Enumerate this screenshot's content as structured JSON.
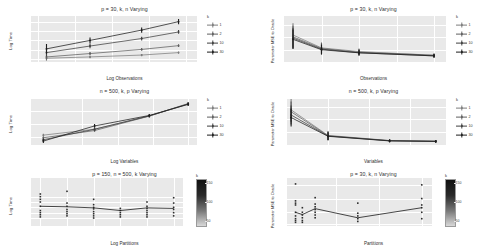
{
  "figure": {
    "style": "ggplot2-grey",
    "layout": "2 columns x 3 rows of facet panels",
    "panel_bg": "#e9e9e9",
    "grid_color": "#ffffff"
  },
  "series_colors": [
    "#7d7d7d",
    "#5f5f5f",
    "#3f3f3f",
    "#1d1d1d"
  ],
  "chart_data": [
    {
      "id": "time-vs-observations",
      "type": "line",
      "title": "p = 30, k, n Varying",
      "xlabel": "Log Observations",
      "ylabel": "Log Time",
      "xlim": [
        4.9,
        7.15
      ],
      "ylim": [
        5.85,
        8.3
      ],
      "xticks": [
        "5.0",
        "5.5",
        "6.0",
        "6.5",
        "7.0"
      ],
      "xtickvals": [
        5.0,
        5.5,
        6.0,
        6.5,
        7.0
      ],
      "yticks": [
        "6.0",
        "6.5",
        "7.0",
        "7.5",
        "8.0"
      ],
      "ytickvals": [
        6.0,
        6.5,
        7.0,
        7.5,
        8.0
      ],
      "grid": true,
      "legend_title": "k",
      "legend_position": "right",
      "x": [
        5.11,
        5.7,
        6.4,
        6.9
      ],
      "series": [
        {
          "name": "1",
          "values": [
            6.05,
            6.12,
            6.22,
            6.35
          ],
          "err": [
            0.13,
            0.07,
            0.06,
            0.06
          ]
        },
        {
          "name": "2",
          "values": [
            6.12,
            6.3,
            6.52,
            6.72
          ],
          "err": [
            0.14,
            0.08,
            0.07,
            0.07
          ]
        },
        {
          "name": "10",
          "values": [
            6.35,
            6.7,
            7.1,
            7.45
          ],
          "err": [
            0.2,
            0.12,
            0.1,
            0.1
          ]
        },
        {
          "name": "30",
          "values": [
            6.55,
            7.0,
            7.55,
            8.0
          ],
          "err": [
            0.26,
            0.16,
            0.14,
            0.14
          ]
        }
      ]
    },
    {
      "id": "mse-vs-observations",
      "type": "line",
      "title": "p = 30, k, n Varying",
      "xlabel": "Observations",
      "ylabel": "Parameter MSE to Oracle",
      "xlim": [
        0,
        1080
      ],
      "ylim": [
        0.0,
        0.0075
      ],
      "xticks": [
        "250",
        "500",
        "750",
        "1000"
      ],
      "xtickvals": [
        250,
        500,
        750,
        1000
      ],
      "yticks": [
        "0.006",
        "0.004",
        "0.002"
      ],
      "ytickvals": [
        0.006,
        0.004,
        0.002
      ],
      "grid": true,
      "legend_title": "k",
      "legend_position": "right",
      "x": [
        60,
        250,
        500,
        1000
      ],
      "series": [
        {
          "name": "1",
          "values": [
            0.0044,
            0.0023,
            0.0017,
            0.0011
          ],
          "err": [
            0.0019,
            0.0009,
            0.0005,
            0.0003
          ]
        },
        {
          "name": "2",
          "values": [
            0.0041,
            0.0022,
            0.0016,
            0.0011
          ],
          "err": [
            0.0018,
            0.0009,
            0.0005,
            0.0003
          ]
        },
        {
          "name": "10",
          "values": [
            0.0039,
            0.0021,
            0.0015,
            0.001
          ],
          "err": [
            0.0017,
            0.0008,
            0.0005,
            0.0003
          ]
        },
        {
          "name": "30",
          "values": [
            0.0037,
            0.002,
            0.0015,
            0.001
          ],
          "err": [
            0.0016,
            0.0008,
            0.0004,
            0.0003
          ]
        }
      ]
    },
    {
      "id": "time-vs-variables",
      "type": "line",
      "title": "n = 500, k, p Varying",
      "xlabel": "Log Variables",
      "ylabel": "Log Time",
      "xlim": [
        0.55,
        5.25
      ],
      "ylim": [
        5.4,
        8.9
      ],
      "xticks": [
        "2",
        "3",
        "4",
        "5"
      ],
      "xtickvals": [
        2,
        3,
        4,
        5
      ],
      "yticks": [
        "8",
        "7",
        "6"
      ],
      "ytickvals": [
        8,
        7,
        6
      ],
      "grid": true,
      "legend_title": "k",
      "legend_position": "right",
      "x": [
        0.9,
        2.35,
        3.9,
        5.0
      ],
      "series": [
        {
          "name": "1",
          "values": [
            6.15,
            6.6,
            7.6,
            8.55
          ],
          "err": [
            0.1,
            0.1,
            0.1,
            0.12
          ]
        },
        {
          "name": "2",
          "values": [
            5.95,
            6.5,
            7.6,
            8.55
          ],
          "err": [
            0.1,
            0.1,
            0.1,
            0.12
          ]
        },
        {
          "name": "10",
          "values": [
            5.8,
            6.6,
            7.62,
            8.5
          ],
          "err": [
            0.12,
            0.12,
            0.1,
            0.12
          ]
        },
        {
          "name": "30",
          "values": [
            5.7,
            6.85,
            7.65,
            8.5
          ],
          "err": [
            0.14,
            0.14,
            0.1,
            0.12
          ]
        }
      ]
    },
    {
      "id": "mse-vs-variables",
      "type": "line",
      "title": "n = 500, k, p Varying",
      "xlabel": "Variables",
      "ylabel": "Parameter MSE to Oracle",
      "xlim": [
        0,
        155
      ],
      "ylim": [
        0.0,
        0.0036
      ],
      "xticks": [
        "40",
        "80",
        "120"
      ],
      "xtickvals": [
        40,
        80,
        120
      ],
      "yticks": [
        "0.0075",
        "0.0050",
        "0.0025",
        "0.0000"
      ],
      "ytickvals": [
        0.003,
        0.002,
        0.001,
        0.0
      ],
      "grid": true,
      "legend_title": "k",
      "legend_position": "right",
      "x": [
        4,
        40,
        100,
        145
      ],
      "series": [
        {
          "name": "1",
          "values": [
            0.00275,
            0.00075,
            0.00035,
            0.0003
          ],
          "err": [
            0.00085,
            0.00035,
            0.00012,
            0.0001
          ]
        },
        {
          "name": "2",
          "values": [
            0.0026,
            0.00072,
            0.00034,
            0.00029
          ],
          "err": [
            0.0008,
            0.00033,
            0.00012,
            0.0001
          ]
        },
        {
          "name": "10",
          "values": [
            0.00235,
            0.0007,
            0.00033,
            0.00029
          ],
          "err": [
            0.00075,
            0.00032,
            0.00011,
            0.0001
          ]
        },
        {
          "name": "30",
          "values": [
            0.00215,
            0.00068,
            0.00032,
            0.00028
          ],
          "err": [
            0.0007,
            0.0003,
            0.00011,
            0.0001
          ]
        }
      ]
    },
    {
      "id": "time-vs-partitions",
      "type": "scatter",
      "title": "p = 150, n = 500, k Varying",
      "xlabel": "Log Partitions",
      "ylabel": "Log Time",
      "xlim": [
        -0.35,
        5.35
      ],
      "ylim": [
        10.45,
        11.35
      ],
      "xticks": [
        "0",
        "1",
        "2",
        "3",
        "4",
        "5"
      ],
      "xtickvals": [
        0,
        1,
        2,
        3,
        4,
        5
      ],
      "yticks": [
        "11.0",
        "10.9",
        "10.8",
        "10.7",
        "10.6"
      ],
      "ytickvals": [
        11.0,
        10.9,
        10.8,
        10.7,
        10.6
      ],
      "grid": true,
      "legend_title": "k",
      "legend_type": "colorbar",
      "legend_ticks": [
        "150",
        "100",
        "50"
      ],
      "legend_tickvals": [
        150,
        100,
        50
      ],
      "trend_x": [
        0,
        1,
        2,
        3,
        4,
        5
      ],
      "trend_y": [
        10.82,
        10.81,
        10.79,
        10.74,
        10.79,
        10.78
      ],
      "points": [
        {
          "x": 0,
          "y": [
            11.05,
            11.0,
            10.95,
            10.9,
            10.82,
            10.74,
            10.7,
            10.66,
            10.62
          ]
        },
        {
          "x": 1,
          "y": [
            11.1,
            10.88,
            10.82,
            10.76,
            10.72,
            10.68,
            10.64
          ]
        },
        {
          "x": 2,
          "y": [
            10.95,
            10.85,
            10.8,
            10.77,
            10.72,
            10.68,
            10.64,
            10.6
          ]
        },
        {
          "x": 3,
          "y": [
            10.78,
            10.74,
            10.7,
            10.66,
            10.62
          ]
        },
        {
          "x": 4,
          "y": [
            10.9,
            10.82,
            10.78,
            10.74,
            10.7,
            10.66,
            10.62
          ]
        },
        {
          "x": 5,
          "y": [
            10.98,
            10.88,
            10.8,
            10.76,
            10.7,
            10.64
          ]
        }
      ]
    },
    {
      "id": "mse-vs-partitions",
      "type": "scatter",
      "title": "p = 30, k, n Varying",
      "xlabel": "Partitions",
      "ylabel": "Parameter MSE to Oracle",
      "xlim": [
        -8,
        162
      ],
      "ylim": [
        0.0,
        0.0105
      ],
      "xticks": [
        "50",
        "100",
        "150"
      ],
      "xtickvals": [
        50,
        100,
        150
      ],
      "yticks": [
        "0.00150",
        "0.00100",
        "0.00050",
        "0.00000"
      ],
      "ytickvals": [
        0.009,
        0.006,
        0.003,
        0.0005
      ],
      "grid": true,
      "legend_title": "k",
      "legend_type": "colorbar",
      "legend_ticks": [
        "150",
        "100",
        "50"
      ],
      "legend_tickvals": [
        150,
        100,
        50
      ],
      "trend_x": [
        2,
        10,
        25,
        75,
        150
      ],
      "trend_y": [
        0.003,
        0.0025,
        0.0038,
        0.0018,
        0.004
      ],
      "points": [
        {
          "x": 2,
          "y": [
            0.0092,
            0.0055,
            0.005,
            0.0046,
            0.003,
            0.0022,
            0.0016,
            0.0012,
            0.0008
          ]
        },
        {
          "x": 10,
          "y": [
            0.004,
            0.003,
            0.0024,
            0.0018,
            0.0012,
            0.0008
          ]
        },
        {
          "x": 25,
          "y": [
            0.0062,
            0.0048,
            0.0042,
            0.0036,
            0.003,
            0.0024,
            0.0018
          ]
        },
        {
          "x": 75,
          "y": [
            0.005,
            0.0028,
            0.0022,
            0.0016,
            0.001
          ]
        },
        {
          "x": 150,
          "y": [
            0.009,
            0.006,
            0.0046,
            0.004,
            0.003,
            0.0016
          ]
        }
      ]
    }
  ]
}
